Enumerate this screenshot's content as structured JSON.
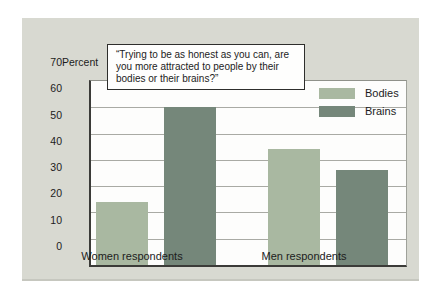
{
  "figure": {
    "ylabel": "Percent",
    "question": "“Trying to be as honest as you can, are you more attracted to people by their bodies or their brains?”"
  },
  "chart_data": {
    "type": "bar",
    "title": "“Trying to be as honest as you can, are you more attracted to people by their bodies or their brains?”",
    "categories": [
      "Women respondents",
      "Men respondents"
    ],
    "series": [
      {
        "name": "Bodies",
        "color": "#a9b8a1",
        "values": [
          24,
          44
        ]
      },
      {
        "name": "Brains",
        "color": "#75877a",
        "values": [
          60,
          36
        ]
      }
    ],
    "xlabel": "",
    "ylabel": "Percent",
    "ylim": [
      0,
      70
    ],
    "ytick_step": 10,
    "ytick_labels": [
      "0",
      "10",
      "20",
      "30",
      "40",
      "50",
      "60",
      "70"
    ],
    "grid": true,
    "legend_position": "upper-right"
  },
  "colors": {
    "panel_bg": "#d8d9d1",
    "plot_bg": "#fdfdfc",
    "gridline": "#a9aaa4",
    "axis": "#3b3b38",
    "text": "#1c1c1c"
  }
}
